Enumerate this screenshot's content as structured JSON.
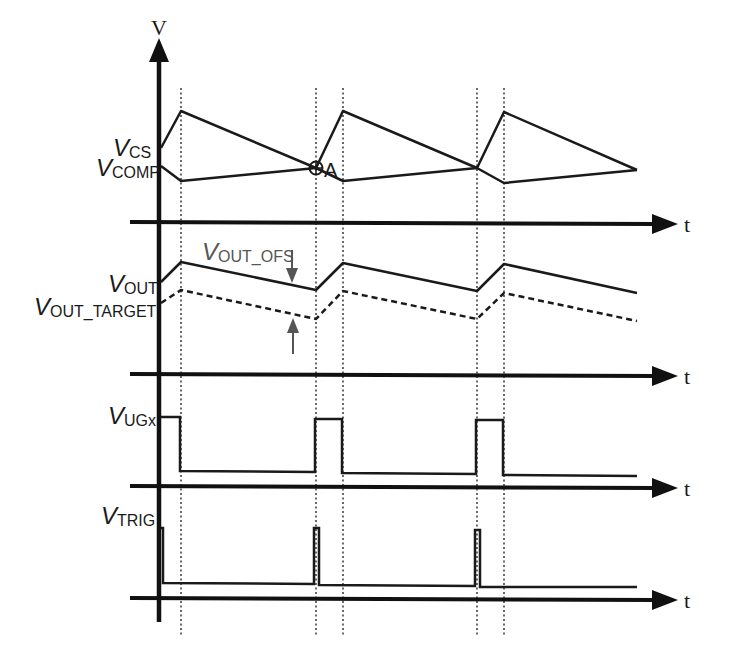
{
  "figure": {
    "type": "timing-diagram",
    "y_axis_label": "V",
    "time_axis_label": "t",
    "point_annotation": "A",
    "colors": {
      "line": "#1a1a1a",
      "annotation": "#555555",
      "background": "#ffffff"
    }
  },
  "signals": [
    {
      "id": "vcs",
      "label_main": "V",
      "label_sub": "CS",
      "style": "solid"
    },
    {
      "id": "vcomp",
      "label_main": "V",
      "label_sub": "COMP",
      "style": "solid"
    },
    {
      "id": "vout",
      "label_main": "V",
      "label_sub": "OUT",
      "style": "solid"
    },
    {
      "id": "vout_target",
      "label_main": "V",
      "label_sub": "OUT_TARGET",
      "style": "dashed"
    },
    {
      "id": "vugx",
      "label_main": "V",
      "label_sub": "UGx",
      "style": "solid"
    },
    {
      "id": "vtrig",
      "label_main": "V",
      "label_sub": "TRIG",
      "style": "solid"
    }
  ],
  "annotations": {
    "offset": {
      "label_main": "V",
      "label_sub": "OUT_OFS"
    }
  },
  "panels": [
    {
      "name": "current-sense-vs-comp",
      "time_axis": "t"
    },
    {
      "name": "output-voltage",
      "time_axis": "t"
    },
    {
      "name": "upper-gate",
      "time_axis": "t"
    },
    {
      "name": "trigger",
      "time_axis": "t"
    }
  ]
}
